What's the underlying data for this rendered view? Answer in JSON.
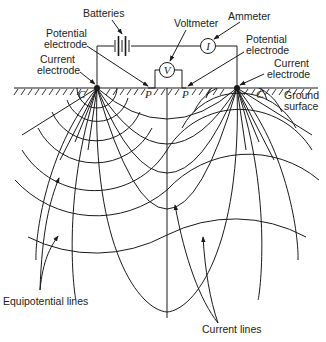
{
  "diagram": {
    "labels": {
      "batteries": "Batteries",
      "voltmeter": "Voltmeter",
      "ammeter": "Ammeter",
      "potential_electrode_left": [
        "Potential",
        "electrode"
      ],
      "potential_electrode_right": [
        "Potential",
        "electrode"
      ],
      "current_electrode_left": [
        "Current",
        "electrode"
      ],
      "current_electrode_right": [
        "Current",
        "electrode"
      ],
      "ground_surface": [
        "Ground",
        "surface"
      ],
      "equipotential_lines": "Equipotential lines",
      "current_lines": "Current lines"
    },
    "symbols": {
      "voltmeter": "V",
      "ammeter": "I",
      "current_electrode_left": "C",
      "current_electrode_right": "C",
      "potential_electrode_left": "P",
      "potential_electrode_right": "P"
    },
    "colors": {
      "line": "#1a1a1a",
      "background": "#ffffff",
      "text": "#222222"
    }
  }
}
